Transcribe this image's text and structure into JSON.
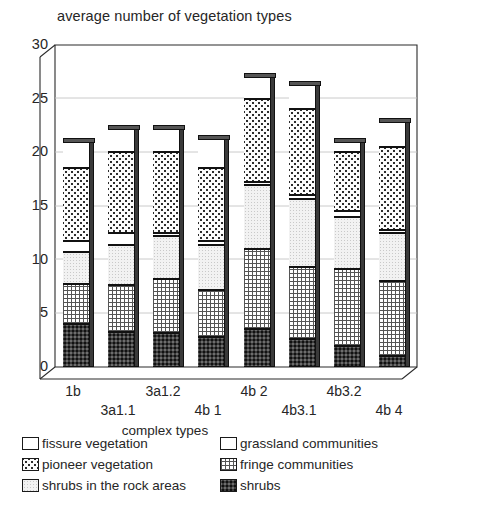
{
  "chart_data": {
    "type": "bar",
    "subtype": "stacked-3d-column",
    "title": "average number of vegetation types",
    "xlabel": "complex types",
    "ylabel": "",
    "ylim": [
      0,
      30
    ],
    "yticks": [
      0,
      5,
      10,
      15,
      20,
      25,
      30
    ],
    "grid": true,
    "legend_position": "bottom",
    "categories": [
      "1b",
      "3a1.1",
      "3a1.2",
      "4b 1",
      "4b 2",
      "4b3.1",
      "4b3.2",
      "4b 4"
    ],
    "series": [
      {
        "name": "shrubs",
        "pattern": "shrubs",
        "values": [
          4.0,
          3.3,
          3.2,
          2.8,
          3.5,
          2.6,
          2.0,
          1.0
        ]
      },
      {
        "name": "fringe communities",
        "pattern": "fringe",
        "values": [
          3.7,
          4.3,
          5.0,
          4.4,
          7.5,
          6.7,
          7.1,
          7.0
        ]
      },
      {
        "name": "shrubs in the rock areas",
        "pattern": "shrubsrock",
        "values": [
          3.0,
          3.8,
          4.0,
          4.2,
          6.0,
          6.4,
          4.9,
          4.5
        ]
      },
      {
        "name": "grassland communities",
        "pattern": "grassland",
        "values": [
          1.0,
          1.1,
          0.3,
          0.3,
          0.2,
          0.3,
          0.5,
          0.3
        ]
      },
      {
        "name": "pioneer vegetation",
        "pattern": "pioneer",
        "values": [
          6.8,
          7.5,
          7.5,
          6.8,
          7.8,
          8.0,
          5.5,
          7.7
        ]
      },
      {
        "name": "fissure vegetation",
        "pattern": "fissure",
        "values": [
          2.5,
          2.2,
          2.2,
          2.7,
          2.0,
          2.3,
          1.0,
          2.3
        ]
      }
    ],
    "totals": [
      21.0,
      22.2,
      22.2,
      21.2,
      27.0,
      26.3,
      21.0,
      22.8
    ]
  },
  "legend": {
    "rows": [
      [
        {
          "label": "fissure vegetation",
          "pattern": "fissure"
        },
        {
          "label": "grassland communities",
          "pattern": "grassland"
        }
      ],
      [
        {
          "label": "pioneer vegetation",
          "pattern": "pioneer"
        },
        {
          "label": "fringe communities",
          "pattern": "fringe"
        }
      ],
      [
        {
          "label": "shrubs in the rock areas",
          "pattern": "shrubsrock"
        },
        {
          "label": "shrubs",
          "pattern": "shrubs"
        }
      ]
    ]
  },
  "caption": {
    "text": ""
  }
}
